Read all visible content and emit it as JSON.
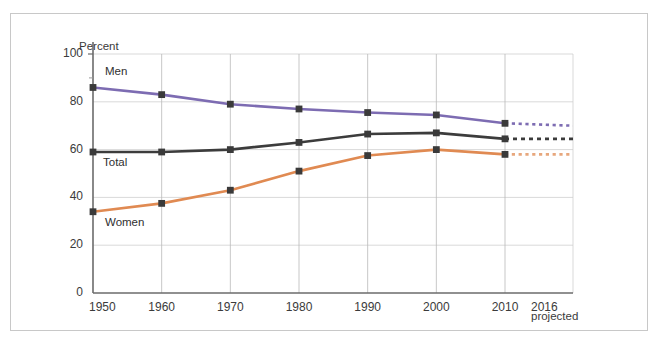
{
  "axis_title": "Percent",
  "x_axis_note": "projected",
  "chart_data": {
    "type": "line",
    "title": "",
    "xlabel": "",
    "ylabel": "Percent",
    "ylim": [
      0,
      100
    ],
    "yticks": [
      0,
      20,
      40,
      60,
      80,
      100
    ],
    "xticks": [
      "1950",
      "1960",
      "1970",
      "1980",
      "1990",
      "2000",
      "2010",
      "2016"
    ],
    "x": [
      1950,
      1960,
      1970,
      1980,
      1990,
      2000,
      2010,
      2016
    ],
    "grid": true,
    "legend": "inline-labels",
    "annotations": [
      "projected"
    ],
    "series": [
      {
        "name": "Men",
        "color": "#7d6cb2",
        "values": [
          86,
          83,
          79,
          77,
          75.5,
          74.5,
          71,
          70
        ],
        "solid_through": 2010,
        "projected_from": 2010
      },
      {
        "name": "Total",
        "color": "#3c3c3c",
        "values": [
          59,
          59,
          60,
          63,
          66.5,
          67,
          64.5,
          64.5
        ],
        "solid_through": 2010,
        "projected_from": 2010
      },
      {
        "name": "Women",
        "color": "#e08a52",
        "values": [
          34,
          37.5,
          43,
          51,
          57.5,
          60,
          58,
          58
        ],
        "solid_through": 2010,
        "projected_from": 2010
      }
    ]
  }
}
